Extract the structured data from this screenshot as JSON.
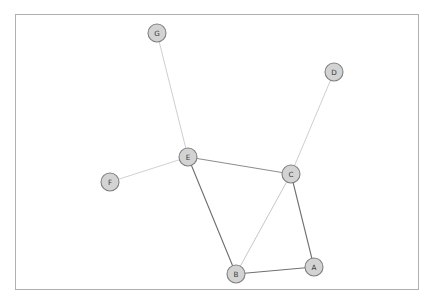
{
  "canvas": {
    "width": 434,
    "height": 305,
    "background": "#ffffff"
  },
  "frame": {
    "x": 15.5,
    "y": 14.5,
    "width": 403,
    "height": 275,
    "stroke": "#b0b0b0",
    "stroke_width": 1,
    "fill": "#ffffff"
  },
  "chart_data": {
    "type": "diagram",
    "diagram_kind": "node-link-graph",
    "title": "",
    "directed": false,
    "node_style": {
      "radius": 9,
      "fill": "#d3d3d3",
      "stroke": "#808080",
      "stroke_width": 1.1,
      "label_color": "#3a3a3a"
    },
    "nodes": [
      {
        "id": "A",
        "label": "A",
        "x": 314,
        "y": 267
      },
      {
        "id": "B",
        "label": "B",
        "x": 236,
        "y": 274
      },
      {
        "id": "C",
        "label": "C",
        "x": 291,
        "y": 174
      },
      {
        "id": "D",
        "label": "D",
        "x": 334,
        "y": 72
      },
      {
        "id": "E",
        "label": "E",
        "x": 188,
        "y": 157
      },
      {
        "id": "F",
        "label": "F",
        "x": 110,
        "y": 182
      },
      {
        "id": "G",
        "label": "G",
        "x": 157,
        "y": 33
      }
    ],
    "edges": [
      {
        "source": "G",
        "target": "E",
        "color": "#c8c8c8",
        "width": 0.9
      },
      {
        "source": "F",
        "target": "E",
        "color": "#cccccc",
        "width": 0.9
      },
      {
        "source": "E",
        "target": "C",
        "color": "#8c8c8c",
        "width": 1.0
      },
      {
        "source": "E",
        "target": "B",
        "color": "#6e6e6e",
        "width": 1.1
      },
      {
        "source": "C",
        "target": "D",
        "color": "#c8c8c8",
        "width": 0.9
      },
      {
        "source": "C",
        "target": "B",
        "color": "#c0c0c0",
        "width": 0.9
      },
      {
        "source": "C",
        "target": "A",
        "color": "#707070",
        "width": 1.1
      },
      {
        "source": "B",
        "target": "A",
        "color": "#707070",
        "width": 1.1
      }
    ],
    "legend": [],
    "annotations": []
  }
}
